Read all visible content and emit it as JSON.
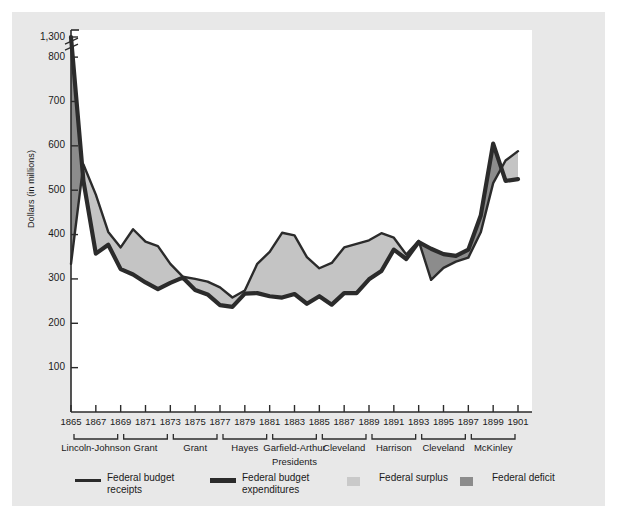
{
  "figure": {
    "background": "#e8e8e8",
    "plot_background": "#ffffff"
  },
  "chart_data": {
    "type": "area",
    "title": "",
    "xlabel": "Presidents",
    "ylabel": "Dollars (in millions)",
    "x": [
      1865,
      1866,
      1867,
      1868,
      1869,
      1870,
      1871,
      1872,
      1873,
      1874,
      1875,
      1876,
      1877,
      1878,
      1879,
      1880,
      1881,
      1882,
      1883,
      1884,
      1885,
      1886,
      1887,
      1888,
      1889,
      1890,
      1891,
      1892,
      1893,
      1894,
      1895,
      1896,
      1897,
      1898,
      1899,
      1900,
      1901
    ],
    "xtick_labels": [
      "1865",
      "1867",
      "1869",
      "1871",
      "1873",
      "1875",
      "1877",
      "1879",
      "1881",
      "1883",
      "1885",
      "1887",
      "1889",
      "1891",
      "1893",
      "1895",
      "1897",
      "1899",
      "1901"
    ],
    "ytick_labels": [
      "100",
      "200",
      "300",
      "400",
      "500",
      "600",
      "700",
      "800",
      "1,300"
    ],
    "ytick_values": [
      100,
      200,
      300,
      400,
      500,
      600,
      700,
      800,
      1300
    ],
    "ylim": [
      0,
      1300
    ],
    "axis_break": {
      "below": 800,
      "above": 1300,
      "present": true
    },
    "grid": false,
    "legend_position": "bottom",
    "series": [
      {
        "name": "Federal budget receipts",
        "style": "thin-line",
        "color": "#2b2b2b",
        "values": [
          334,
          558,
          490,
          406,
          371,
          412,
          384,
          374,
          334,
          305,
          300,
          294,
          281,
          258,
          274,
          334,
          361,
          404,
          398,
          349,
          324,
          336,
          371,
          379,
          387,
          403,
          393,
          355,
          386,
          298,
          325,
          339,
          348,
          405,
          516,
          567,
          588
        ]
      },
      {
        "name": "Federal budget expenditures",
        "style": "thick-line",
        "color": "#2b2b2b",
        "values": [
          1298,
          521,
          357,
          377,
          322,
          310,
          292,
          277,
          291,
          303,
          275,
          265,
          241,
          237,
          267,
          268,
          261,
          258,
          266,
          244,
          261,
          242,
          268,
          268,
          299,
          318,
          366,
          345,
          383,
          368,
          356,
          352,
          366,
          443,
          605,
          521,
          525
        ]
      }
    ],
    "bands": [
      {
        "name": "Federal surplus",
        "color": "#c4c4c4",
        "meaning": "receipts above expenditures"
      },
      {
        "name": "Federal deficit",
        "color": "#8c8c8c",
        "meaning": "expenditures above receipts"
      }
    ],
    "presidents": [
      {
        "label": "Lincoln-Johnson",
        "start": 1865,
        "end": 1869
      },
      {
        "label": "Grant",
        "start": 1869,
        "end": 1873
      },
      {
        "label": "Grant",
        "start": 1873,
        "end": 1877
      },
      {
        "label": "Hayes",
        "start": 1877,
        "end": 1881
      },
      {
        "label": "Garfield-Arthur",
        "start": 1881,
        "end": 1885
      },
      {
        "label": "Cleveland",
        "start": 1885,
        "end": 1889
      },
      {
        "label": "Harrison",
        "start": 1889,
        "end": 1893
      },
      {
        "label": "Cleveland",
        "start": 1893,
        "end": 1897
      },
      {
        "label": "McKinley",
        "start": 1897,
        "end": 1901
      }
    ]
  },
  "legend": {
    "items": [
      {
        "label_line1": "Federal budget",
        "label_line2": "receipts",
        "type": "thin-line",
        "color": "#2b2b2b"
      },
      {
        "label_line1": "Federal budget",
        "label_line2": "expenditures",
        "type": "thick-line",
        "color": "#2b2b2b"
      },
      {
        "label_line1": "Federal surplus",
        "label_line2": "",
        "type": "swatch",
        "color": "#c9c9c9"
      },
      {
        "label_line1": "Federal deficit",
        "label_line2": "",
        "type": "swatch",
        "color": "#8c8c8c"
      }
    ]
  }
}
